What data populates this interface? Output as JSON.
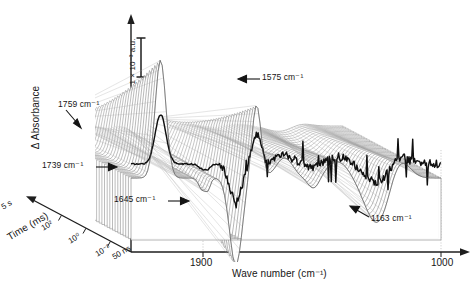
{
  "figure": {
    "kind": "3d-waterfall-surface",
    "background": "#ffffff",
    "line_color": "#2b2b2b",
    "mesh_color": "#8c8c8c",
    "front_trace_color": "#111111"
  },
  "axes": {
    "y": {
      "label": "Δ Absorbance",
      "arrow": "up",
      "scalebar": {
        "label": "1 × 10⁻³ a.u.",
        "value": 0.001,
        "unit": "a.u."
      }
    },
    "x": {
      "label": "Wave number (cm⁻¹)",
      "arrow": "right",
      "ticks": [
        "1900",
        "1000"
      ],
      "range": [
        2000,
        950
      ],
      "direction": "decreasing"
    },
    "t": {
      "label": "Time (ms)",
      "arrow": "up-left",
      "ticks": [
        "5 s",
        "10²",
        "10⁰",
        "10⁻²",
        "50 ns"
      ],
      "scale": "logarithmic",
      "range": [
        "50 ns",
        "5 s"
      ]
    }
  },
  "annotations": [
    {
      "name": "1759",
      "text": "1759 cm⁻¹",
      "wavenumber": 1759,
      "arrow": "down-right"
    },
    {
      "name": "1575",
      "text": "1575 cm⁻¹",
      "wavenumber": 1575,
      "arrow": "left"
    },
    {
      "name": "1739",
      "text": "1739 cm⁻¹",
      "wavenumber": 1739,
      "arrow": "right"
    },
    {
      "name": "1645",
      "text": "1645 cm⁻¹",
      "wavenumber": 1645,
      "arrow": "right"
    },
    {
      "name": "1163",
      "text": "1163 cm⁻¹",
      "wavenumber": 1163,
      "arrow": "up-left"
    }
  ],
  "chart_data": {
    "type": "line",
    "title": "",
    "xlabel": "Wave number (cm⁻¹)",
    "ylabel": "Δ Absorbance",
    "zlabel": "Time (ms)",
    "xlim": [
      2000,
      950
    ],
    "ylim": [
      -0.0022,
      0.0034
    ],
    "x_ticks": [
      1900,
      1000
    ],
    "z_ticks": [
      "50 ns",
      "10⁻²",
      "10⁰",
      "10²",
      "5 s"
    ],
    "grid": false,
    "legend": null,
    "peaks": [
      {
        "wavenumber": 1759,
        "sign": "negative",
        "note": "shoulder on rear baseline"
      },
      {
        "wavenumber": 1739,
        "sign": "negative",
        "note": "baseline edge feature"
      },
      {
        "wavenumber": 1900,
        "sign": "positive",
        "note": "large positive band, tallest"
      },
      {
        "wavenumber": 1645,
        "sign": "negative",
        "note": "deep negative trough"
      },
      {
        "wavenumber": 1575,
        "sign": "positive",
        "note": "secondary positive band"
      },
      {
        "wavenumber": 1163,
        "sign": "negative",
        "note": "broad negative band"
      }
    ],
    "series": [
      {
        "name": "t = 50 ns (front)",
        "x": [
          2000,
          1975,
          1950,
          1930,
          1912,
          1900,
          1888,
          1872,
          1855,
          1840,
          1822,
          1805,
          1790,
          1775,
          1759,
          1748,
          1739,
          1728,
          1715,
          1700,
          1688,
          1675,
          1662,
          1650,
          1645,
          1638,
          1625,
          1612,
          1600,
          1588,
          1575,
          1562,
          1548,
          1535,
          1520,
          1505,
          1490,
          1475,
          1460,
          1445,
          1430,
          1415,
          1400,
          1385,
          1370,
          1355,
          1340,
          1325,
          1310,
          1295,
          1280,
          1265,
          1250,
          1235,
          1220,
          1205,
          1190,
          1175,
          1163,
          1150,
          1135,
          1120,
          1105,
          1090,
          1075,
          1060,
          1045,
          1030,
          1015,
          1000,
          985,
          970,
          955
        ],
        "y": [
          0.0002,
          0.0002,
          0.0001,
          0.0002,
          0.0001,
          0.0002,
          0.0001,
          0.0002,
          0.0001,
          0.0001,
          0.0002,
          0.0001,
          0.0002,
          0.0001,
          0.0002,
          0.0001,
          0.0002,
          0.0001,
          0.0002,
          0.0001,
          0.0002,
          -0.0006,
          0.0003,
          0.0011,
          0.0002,
          -0.0008,
          0.0004,
          0.0014,
          -0.0003,
          0.0005,
          0.0016,
          0.0001,
          -0.0005,
          0.0006,
          0.0002,
          -0.0007,
          0.0005,
          0.0009,
          -0.0004,
          0.0007,
          0.0003,
          -0.0006,
          0.0008,
          0.0002,
          0.0006,
          -0.0009,
          0.0004,
          0.001,
          0.0003,
          -0.0005,
          0.0007,
          0.0002,
          0.0009,
          -0.0004,
          0.0006,
          0.0012,
          0.0002,
          -0.001,
          0.0005,
          0.0011,
          0.0004,
          -0.0007,
          0.0009,
          0.0003,
          0.0013,
          -0.0005,
          0.0008,
          -0.0012,
          0.0006,
          0.0015,
          0.0004,
          0.001,
          0.0007
        ]
      },
      {
        "name": "t = 5 s (rear)",
        "x": [
          2000,
          1950,
          1900,
          1850,
          1800,
          1759,
          1739,
          1700,
          1650,
          1645,
          1600,
          1575,
          1500,
          1450,
          1400,
          1350,
          1300,
          1250,
          1200,
          1163,
          1100,
          1050,
          1000,
          955
        ],
        "y": [
          5e-05,
          5e-05,
          5e-05,
          5e-05,
          4e-05,
          -8e-05,
          -0.0001,
          3e-05,
          2e-05,
          1e-05,
          3e-05,
          6e-05,
          4e-05,
          3e-05,
          4e-05,
          3e-05,
          2e-05,
          3e-05,
          2e-05,
          -4e-05,
          2e-05,
          3e-05,
          2e-05,
          2e-05
        ]
      }
    ],
    "surface_note": "Approximately 40 stacked difference spectra form a mesh surface; amplitude grows from the rear (5 s) to the front (50 ns)."
  }
}
